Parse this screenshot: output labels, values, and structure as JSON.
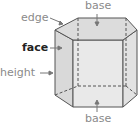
{
  "diagram": {
    "labels": {
      "base_top": "base",
      "edge": "edge",
      "face": "face",
      "height": "height",
      "base_bottom": "base"
    },
    "colors": {
      "label_gray": "#8a8a8a",
      "label_emphasis": "#222222",
      "face_fill": "#e6e6e6",
      "top_fill": "#dcdcdc",
      "edge_stroke": "#555555",
      "arrow": "#777777"
    }
  }
}
